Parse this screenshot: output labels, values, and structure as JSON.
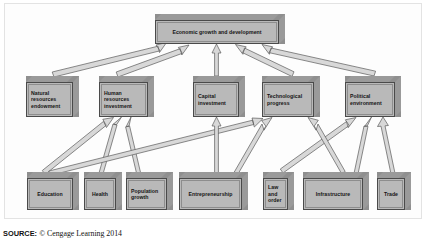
{
  "figure": {
    "nodes": {
      "top": {
        "label": "Economic growth and development"
      },
      "middle": [
        {
          "key": "natural",
          "label": "Natural\nresources\nendowment"
        },
        {
          "key": "human",
          "label": "Human\nresources\ninvestment"
        },
        {
          "key": "capital",
          "label": "Capital\ninvestment"
        },
        {
          "key": "technological",
          "label": "Technological\nprogress"
        },
        {
          "key": "political",
          "label": "Political\nenvironment"
        }
      ],
      "bottom": [
        {
          "key": "education",
          "label": "Education"
        },
        {
          "key": "health",
          "label": "Health"
        },
        {
          "key": "population",
          "label": "Population\ngrowth"
        },
        {
          "key": "entrepreneurship",
          "label": "Entrepreneurship"
        },
        {
          "key": "law",
          "label": "Law\nand\norder"
        },
        {
          "key": "infrastructure",
          "label": "Infrastructure"
        },
        {
          "key": "trade",
          "label": "Trade"
        }
      ]
    },
    "edges": [
      {
        "from": "natural",
        "to": "top"
      },
      {
        "from": "human",
        "to": "top"
      },
      {
        "from": "capital",
        "to": "top"
      },
      {
        "from": "technological",
        "to": "top"
      },
      {
        "from": "political",
        "to": "top"
      },
      {
        "from": "education",
        "to": "human"
      },
      {
        "from": "health",
        "to": "human"
      },
      {
        "from": "population",
        "to": "human"
      },
      {
        "from": "education",
        "to": "technological"
      },
      {
        "from": "entrepreneurship",
        "to": "capital"
      },
      {
        "from": "entrepreneurship",
        "to": "technological"
      },
      {
        "from": "law",
        "to": "political"
      },
      {
        "from": "infrastructure",
        "to": "technological"
      },
      {
        "from": "infrastructure",
        "to": "political"
      },
      {
        "from": "trade",
        "to": "political"
      }
    ],
    "colors": {
      "box_face": "#b9b9b9",
      "box_shade": "#9a9a9a",
      "box_outline": "#4a4a4a",
      "arrow_fill": "#d8d8d8",
      "arrow_outline": "#5a5a5a",
      "frame": "#e3e3e3",
      "text": "#141414"
    }
  },
  "source": {
    "key": "SOURCE:",
    "value": "© Cengage Learning 2014"
  }
}
